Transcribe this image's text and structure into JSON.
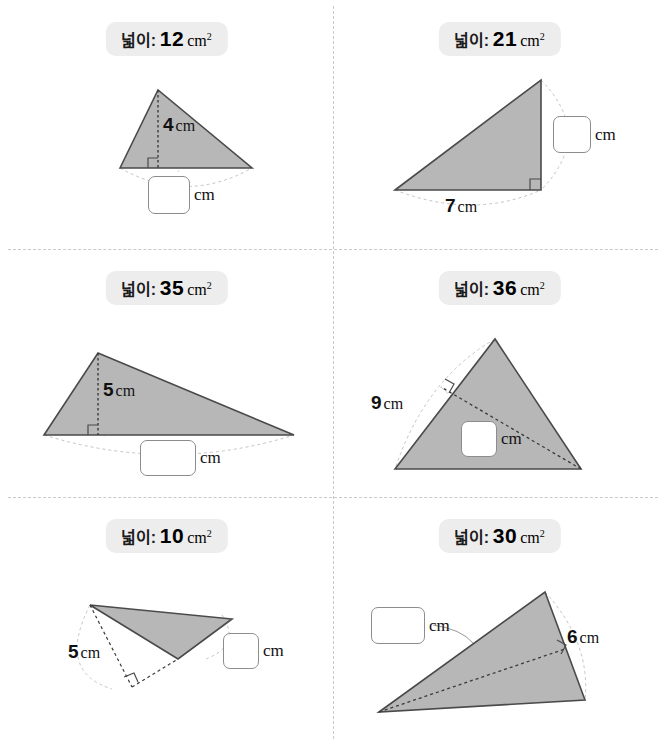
{
  "worksheet": {
    "area_label_ko": "넓이:",
    "unit": "cm",
    "unit_sq_sup": "2",
    "answer_unit": "cm"
  },
  "problems": [
    {
      "id": "problem-1",
      "area_value": "12",
      "area_unit": "cm",
      "given_value": "4",
      "given_unit": "cm",
      "given_kind": "height",
      "answer_unit": "cm",
      "answer_value": ""
    },
    {
      "id": "problem-2",
      "area_value": "21",
      "area_unit": "cm",
      "given_value": "7",
      "given_unit": "cm",
      "given_kind": "base",
      "answer_unit": "cm",
      "answer_value": ""
    },
    {
      "id": "problem-3",
      "area_value": "35",
      "area_unit": "cm",
      "given_value": "5",
      "given_unit": "cm",
      "given_kind": "height",
      "answer_unit": "cm",
      "answer_value": ""
    },
    {
      "id": "problem-4",
      "area_value": "36",
      "area_unit": "cm",
      "given_value": "9",
      "given_unit": "cm",
      "given_kind": "side",
      "answer_unit": "cm",
      "answer_value": ""
    },
    {
      "id": "problem-5",
      "area_value": "10",
      "area_unit": "cm",
      "given_value": "5",
      "given_unit": "cm",
      "given_kind": "height",
      "answer_unit": "cm",
      "answer_value": ""
    },
    {
      "id": "problem-6",
      "area_value": "30",
      "area_unit": "cm",
      "given_value": "6",
      "given_unit": "cm",
      "given_kind": "side",
      "answer_unit": "cm",
      "answer_value": ""
    }
  ],
  "style": {
    "triangle_fill": "#b7b7b7",
    "triangle_stroke": "#4a4a4a",
    "pill_background": "#ededed",
    "divider_color": "#c9c9c9",
    "answer_box_border": "#8d8d8d",
    "guide_color": "#c4c4c4"
  }
}
